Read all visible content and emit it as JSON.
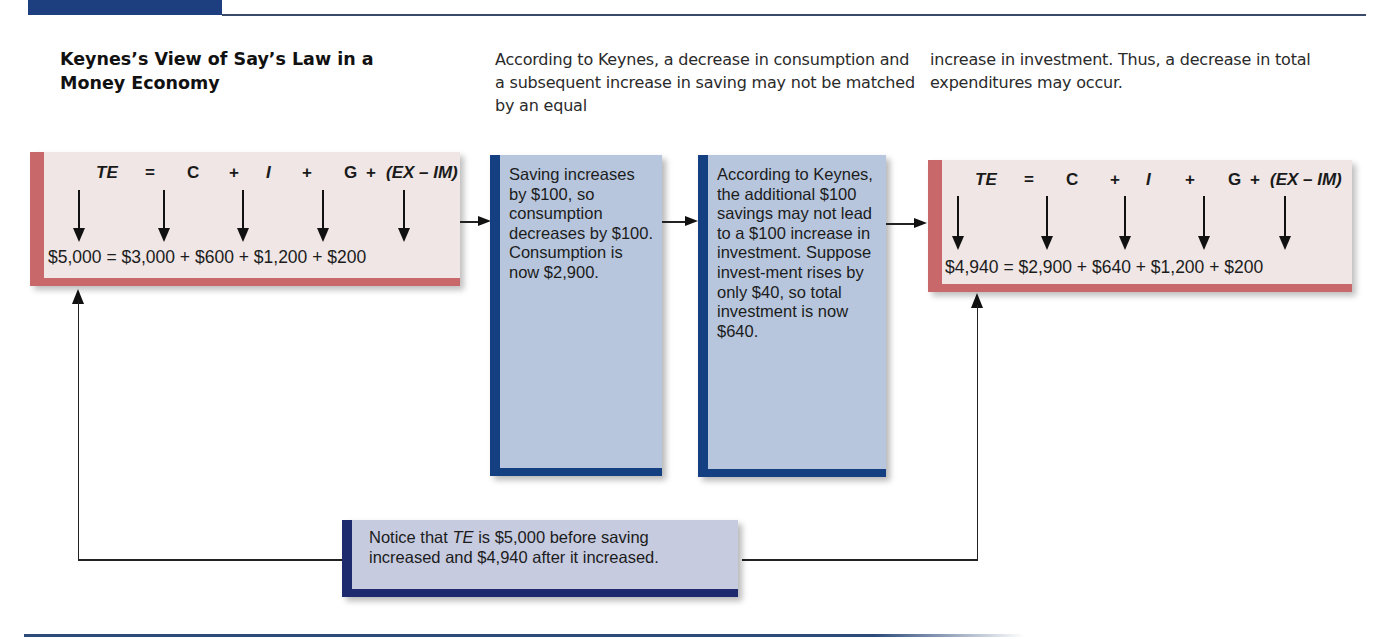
{
  "header": {
    "exhibit_label": ""
  },
  "title": "Keynes’s View of Say’s Law in a Money Economy",
  "intro": {
    "paragraph_1": "According to Keynes, a decrease in consumption and a subsequent increase in saving may not be matched by an equal",
    "paragraph_2": "increase in investment. Thus, a decrease in total expenditures may occur."
  },
  "equation_symbols": {
    "te": "TE",
    "eq": "=",
    "c": "C",
    "plus1": "+",
    "i": "I",
    "plus2": "+",
    "g": "G",
    "plus3": "+",
    "netex": "(EX – IM)"
  },
  "before_box": {
    "values": "$5,000 = $3,000 + $600 + $1,200 + $200",
    "total": "$5,000",
    "consumption": "$3,000",
    "investment": "$600",
    "government": "$1,200",
    "net_exports": "$200"
  },
  "step_saving": {
    "text": "Saving increases by $100, so consumption decreases by $100. Consumption is now $2,900."
  },
  "step_investment": {
    "text": "According to Keynes, the additional $100 savings may not lead to a $100 increase in investment. Suppose invest-ment rises by only $40, so total investment is now $640."
  },
  "after_box": {
    "values": "$4,940 = $2,900 + $640 + $1,200 + $200",
    "total": "$4,940",
    "consumption": "$2,900",
    "investment": "$640",
    "government": "$1,200",
    "net_exports": "$200"
  },
  "note": {
    "line1_prefix": "Notice that ",
    "line1_te": "TE",
    "line1_suffix": " is $5,000 before saving",
    "line2": "increased and $4,940 after it increased."
  },
  "colors": {
    "header_blue": "#1d3f80",
    "pink_fill": "#efe6e5",
    "pink_border": "#c9686a",
    "blue_fill": "#b7c6dd",
    "blue_border": "#143f80",
    "note_fill": "#c6cbe0",
    "note_border": "#1e2a6e"
  }
}
